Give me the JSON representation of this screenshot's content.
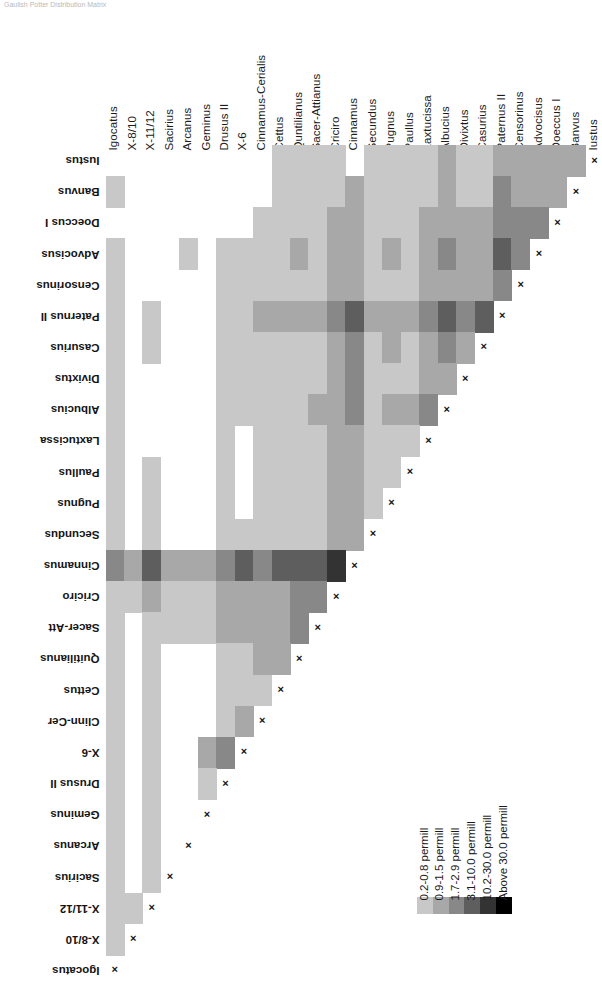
{
  "clipped_header": "Gaulish Potter Distribution Matrix",
  "chart_data": {
    "type": "heatmap",
    "title": "",
    "xlabel": "",
    "ylabel": "",
    "grid": false,
    "legend_position": "bottom-right",
    "note": "Lower-triangular similarity matrix; diagonal marked with x; blank (white) cells = below 0.2 permill / no value",
    "categories": [
      "Igocatus",
      "X-8/10",
      "X-11/12",
      "Sacirius",
      "Arcanus",
      "Geminus",
      "Drusus II",
      "X-6",
      "Cinnamus-Cerialis",
      "Cettus",
      "Quntilianus",
      "Sacer-Attianus",
      "Criciro",
      "Cinnamus",
      "Secundus",
      "Pugnus",
      "Paullus",
      "Laxtucissa",
      "Albucius",
      "Divixtus",
      "Casurius",
      "Paternus II",
      "Censorinus",
      "Advocisus",
      "Doeccus I",
      "Banvus",
      "Iustus"
    ],
    "column_labels": [
      "Igocatus",
      "X-8/10",
      "X-11/12",
      "Sacirius",
      "Arcanus",
      "Geminus",
      "Drusus II",
      "X-6",
      "Cinnamus-Cerialis",
      "Cettus",
      "Quntilianus",
      "Sacer-Attianus",
      "Criciro",
      "Cinnamus",
      "Secundus",
      "Pugnus",
      "Paullus",
      "Laxtucissa",
      "Albucius",
      "Divixtus",
      "Casurius",
      "Paternus II",
      "Censorinus",
      "Advocisus",
      "Doeccus I",
      "Banvus",
      "Iustus"
    ],
    "row_labels_top_to_bottom": [
      "Iustus",
      "Banvus",
      "Doeccus I",
      "Advocisus",
      "Censorinus",
      "Paternus II",
      "Casurius",
      "Divixtus",
      "Albucius",
      "Laxtucissa",
      "Paullus",
      "Pugnus",
      "Secundus",
      "Cinnamus",
      "Criciro",
      "Sacer-Att",
      "Quitilianus",
      "Cettus",
      "Clinn-Cer",
      "X-6",
      "Drusus II",
      "Geminus",
      "Arcanus",
      "Sacirius",
      "X-11/12",
      "X-8/10",
      "Igocatus"
    ],
    "bins": [
      {
        "label": "0.2-0.8 permill",
        "color": "#c8c8c8",
        "index": 1
      },
      {
        "label": "0.9-1.5 permill",
        "color": "#a8a8a8",
        "index": 2
      },
      {
        "label": "1.7-2.9 permill",
        "color": "#888888",
        "index": 3
      },
      {
        "label": "3.1-10.0 permill",
        "color": "#5e5e5e",
        "index": 4
      },
      {
        "label": "10.2-30.0 permill",
        "color": "#333333",
        "index": 5
      },
      {
        "label": "Above 30.0 permill",
        "color": "#000000",
        "index": 6
      }
    ],
    "blank_color": "#ffffff",
    "values_note": "Matrix rows given top-to-bottom matching row_labels_top_to_bottom; each row lists bin index (0=blank) for columns left-to-right matching column_labels; cells at/after the diagonal are null",
    "matrix": [
      [
        0,
        0,
        0,
        0,
        0,
        0,
        0,
        0,
        0,
        1,
        1,
        1,
        1,
        0,
        1,
        1,
        1,
        1,
        2,
        1,
        1,
        2,
        2,
        2,
        2,
        2,
        null
      ],
      [
        1,
        0,
        0,
        0,
        0,
        0,
        0,
        0,
        0,
        1,
        1,
        1,
        1,
        2,
        1,
        1,
        1,
        1,
        2,
        1,
        1,
        3,
        2,
        2,
        2,
        null,
        null
      ],
      [
        0,
        0,
        0,
        0,
        0,
        0,
        0,
        0,
        1,
        1,
        1,
        1,
        2,
        2,
        1,
        1,
        1,
        2,
        2,
        2,
        2,
        3,
        3,
        3,
        null,
        null,
        null
      ],
      [
        1,
        0,
        0,
        0,
        1,
        0,
        1,
        1,
        1,
        1,
        2,
        1,
        2,
        2,
        1,
        2,
        1,
        2,
        3,
        2,
        2,
        4,
        3,
        null,
        null,
        null,
        null
      ],
      [
        1,
        0,
        0,
        0,
        0,
        0,
        1,
        1,
        1,
        1,
        1,
        1,
        2,
        2,
        1,
        1,
        1,
        2,
        2,
        2,
        2,
        3,
        null,
        null,
        null,
        null,
        null
      ],
      [
        1,
        0,
        1,
        0,
        0,
        0,
        1,
        1,
        2,
        2,
        2,
        2,
        3,
        4,
        2,
        2,
        2,
        3,
        4,
        3,
        4,
        null,
        null,
        null,
        null,
        null,
        null
      ],
      [
        1,
        0,
        1,
        0,
        0,
        0,
        1,
        1,
        1,
        1,
        1,
        1,
        2,
        3,
        1,
        2,
        1,
        2,
        3,
        2,
        null,
        null,
        null,
        null,
        null,
        null,
        null
      ],
      [
        1,
        0,
        0,
        0,
        0,
        0,
        1,
        1,
        1,
        1,
        1,
        1,
        2,
        3,
        1,
        1,
        1,
        2,
        2,
        null,
        null,
        null,
        null,
        null,
        null,
        null,
        null
      ],
      [
        1,
        0,
        0,
        0,
        0,
        0,
        1,
        1,
        1,
        1,
        1,
        2,
        2,
        3,
        1,
        2,
        2,
        3,
        null,
        null,
        null,
        null,
        null,
        null,
        null,
        null,
        null
      ],
      [
        1,
        0,
        0,
        0,
        0,
        0,
        1,
        0,
        1,
        1,
        1,
        1,
        2,
        2,
        1,
        1,
        1,
        null,
        null,
        null,
        null,
        null,
        null,
        null,
        null,
        null,
        null
      ],
      [
        1,
        0,
        1,
        0,
        0,
        0,
        1,
        0,
        1,
        1,
        1,
        1,
        2,
        2,
        1,
        1,
        null,
        null,
        null,
        null,
        null,
        null,
        null,
        null,
        null,
        null,
        null
      ],
      [
        1,
        0,
        1,
        0,
        0,
        0,
        1,
        0,
        1,
        1,
        1,
        1,
        2,
        2,
        1,
        null,
        null,
        null,
        null,
        null,
        null,
        null,
        null,
        null,
        null,
        null,
        null
      ],
      [
        1,
        0,
        1,
        0,
        0,
        0,
        1,
        1,
        1,
        1,
        1,
        1,
        2,
        2,
        null,
        null,
        null,
        null,
        null,
        null,
        null,
        null,
        null,
        null,
        null,
        null,
        null
      ],
      [
        3,
        2,
        4,
        2,
        2,
        2,
        3,
        4,
        3,
        4,
        4,
        4,
        5,
        null,
        null,
        null,
        null,
        null,
        null,
        null,
        null,
        null,
        null,
        null,
        null,
        null,
        null
      ],
      [
        1,
        1,
        2,
        1,
        1,
        1,
        2,
        2,
        2,
        2,
        3,
        3,
        null,
        null,
        null,
        null,
        null,
        null,
        null,
        null,
        null,
        null,
        null,
        null,
        null,
        null,
        null
      ],
      [
        1,
        0,
        1,
        1,
        1,
        1,
        2,
        2,
        2,
        2,
        3,
        null,
        null,
        null,
        null,
        null,
        null,
        null,
        null,
        null,
        null,
        null,
        null,
        null,
        null,
        null,
        null
      ],
      [
        1,
        0,
        1,
        0,
        0,
        0,
        1,
        1,
        2,
        2,
        null,
        null,
        null,
        null,
        null,
        null,
        null,
        null,
        null,
        null,
        null,
        null,
        null,
        null,
        null,
        null,
        null
      ],
      [
        1,
        0,
        1,
        0,
        0,
        0,
        1,
        1,
        1,
        null,
        null,
        null,
        null,
        null,
        null,
        null,
        null,
        null,
        null,
        null,
        null,
        null,
        null,
        null,
        null,
        null,
        null
      ],
      [
        1,
        0,
        1,
        0,
        0,
        0,
        1,
        2,
        null,
        null,
        null,
        null,
        null,
        null,
        null,
        null,
        null,
        null,
        null,
        null,
        null,
        null,
        null,
        null,
        null,
        null,
        null
      ],
      [
        1,
        0,
        1,
        0,
        0,
        2,
        3,
        null,
        null,
        null,
        null,
        null,
        null,
        null,
        null,
        null,
        null,
        null,
        null,
        null,
        null,
        null,
        null,
        null,
        null,
        null,
        null
      ],
      [
        1,
        0,
        1,
        0,
        0,
        1,
        null,
        null,
        null,
        null,
        null,
        null,
        null,
        null,
        null,
        null,
        null,
        null,
        null,
        null,
        null,
        null,
        null,
        null,
        null,
        null,
        null
      ],
      [
        1,
        0,
        1,
        0,
        0,
        null,
        null,
        null,
        null,
        null,
        null,
        null,
        null,
        null,
        null,
        null,
        null,
        null,
        null,
        null,
        null,
        null,
        null,
        null,
        null,
        null,
        null
      ],
      [
        1,
        0,
        1,
        0,
        null,
        null,
        null,
        null,
        null,
        null,
        null,
        null,
        null,
        null,
        null,
        null,
        null,
        null,
        null,
        null,
        null,
        null,
        null,
        null,
        null,
        null,
        null
      ],
      [
        1,
        0,
        1,
        null,
        null,
        null,
        null,
        null,
        null,
        null,
        null,
        null,
        null,
        null,
        null,
        null,
        null,
        null,
        null,
        null,
        null,
        null,
        null,
        null,
        null,
        null,
        null
      ],
      [
        1,
        1,
        null,
        null,
        null,
        null,
        null,
        null,
        null,
        null,
        null,
        null,
        null,
        null,
        null,
        null,
        null,
        null,
        null,
        null,
        null,
        null,
        null,
        null,
        null,
        null,
        null
      ],
      [
        1,
        null,
        null,
        null,
        null,
        null,
        null,
        null,
        null,
        null,
        null,
        null,
        null,
        null,
        null,
        null,
        null,
        null,
        null,
        null,
        null,
        null,
        null,
        null,
        null,
        null,
        null
      ],
      [
        null,
        null,
        null,
        null,
        null,
        null,
        null,
        null,
        null,
        null,
        null,
        null,
        null,
        null,
        null,
        null,
        null,
        null,
        null,
        null,
        null,
        null,
        null,
        null,
        null,
        null,
        null
      ]
    ]
  },
  "legend": {
    "title": "",
    "items": [
      "0.2-0.8 permill",
      "0.9-1.5 permill",
      "1.7-2.9 permill",
      "3.1-10.0 permill",
      "10.2-30.0 permill",
      "Above 30.0 permill"
    ]
  },
  "diagonal_marker": "×"
}
